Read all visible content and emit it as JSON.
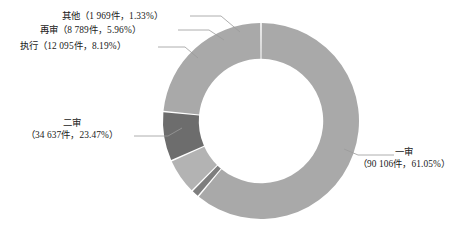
{
  "chart_data": {
    "type": "pie",
    "variant": "donut",
    "title": "",
    "xlabel": "",
    "ylabel": "",
    "legend_position": "none",
    "grid": false,
    "total_count": 147596,
    "unit_suffix": "件",
    "start_angle_deg": 0,
    "direction": "clockwise",
    "inner_radius_ratio": 0.635,
    "categories": [
      "一审",
      "二审",
      "执行",
      "再审",
      "其他"
    ],
    "values": [
      90106,
      34637,
      12095,
      8789,
      1969
    ],
    "percentages": [
      61.05,
      23.47,
      8.19,
      5.96,
      1.33
    ],
    "colors": [
      "#a9a9a9",
      "#a9a9a9",
      "#6d6d6d",
      "#b3b3b3",
      "#7e7e7e"
    ],
    "slices": [
      {
        "name": "一审",
        "count": 90106,
        "count_text": "90 106",
        "percent": 61.05,
        "percent_text": "61.05%",
        "color": "#a9a9a9",
        "label_line1": "一审",
        "label_line2": "（90 106件，61.05%）"
      },
      {
        "name": "二审",
        "count": 34637,
        "count_text": "34 637",
        "percent": 23.47,
        "percent_text": "23.47%",
        "color": "#a9a9a9",
        "label_line1": "二审",
        "label_line2": "（34 637件，23.47%）"
      },
      {
        "name": "执行",
        "count": 12095,
        "count_text": "12 095",
        "percent": 8.19,
        "percent_text": "8.19%",
        "color": "#6d6d6d",
        "label_line1": "执行（12 095件，8.19%）",
        "label_line2": ""
      },
      {
        "name": "再审",
        "count": 8789,
        "count_text": "8 789",
        "percent": 5.96,
        "percent_text": "5.96%",
        "color": "#b3b3b3",
        "label_line1": "再审（8 789件，5.96%）",
        "label_line2": ""
      },
      {
        "name": "其他",
        "count": 1969,
        "count_text": "1 969",
        "percent": 1.33,
        "percent_text": "1.33%",
        "color": "#7e7e7e",
        "label_line1": "其他（1 969件，1.33%）",
        "label_line2": ""
      }
    ]
  },
  "labels": {
    "other": "其他（1 969件，1.33%）",
    "retrial": "再审（8 789件，5.96%）",
    "execution": "执行（12 095件，8.19%）",
    "second_instance_head": "二审",
    "second_instance_detail": "（34 637件，23.47%）",
    "first_instance_head": "一审",
    "first_instance_detail": "（90 106件，61.05%）"
  },
  "style": {
    "background": "#ffffff",
    "text_color": "#1a1a1a",
    "leader_line_color": "#9a9a9a",
    "slice_gap_color": "#ffffff"
  }
}
